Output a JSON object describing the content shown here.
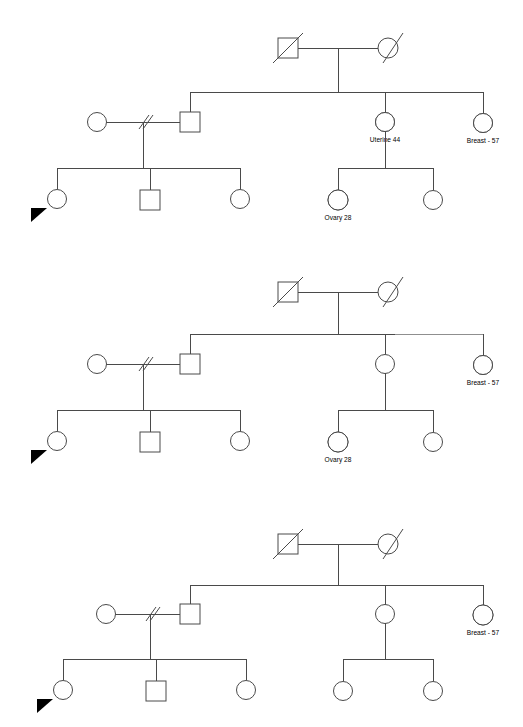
{
  "document": {
    "kind": "pedigree-chart",
    "title": "",
    "background_color": "#ffffff",
    "line_color": "#4a4a4a",
    "affected_fill_color": "#000000",
    "secondary_fill_color": "#3a3a3a",
    "panel_count": 3
  },
  "legend_semantics": {
    "square": "male",
    "circle": "female",
    "diagonal_slash_through_symbol": "deceased",
    "double_slash_on_partner_line": "separated-or-divorced",
    "filled_lower_half": "affected",
    "filled_whole": "affected-multiple",
    "black_triangle": "proband"
  },
  "panels": [
    {
      "id": "pedigree-1",
      "name": "pedigree-panel-1",
      "nodes": [
        {
          "id": "p1-gf",
          "name": "grandfather",
          "sex": "male",
          "deceased": true,
          "fill": "none",
          "label": ""
        },
        {
          "id": "p1-gm",
          "name": "grandmother",
          "sex": "female",
          "deceased": true,
          "fill": "none",
          "label": ""
        },
        {
          "id": "p1-son",
          "name": "son",
          "sex": "male",
          "deceased": false,
          "fill": "none",
          "label": ""
        },
        {
          "id": "p1-sw",
          "name": "sons-former-partner",
          "sex": "female",
          "deceased": false,
          "fill": "none",
          "label": ""
        },
        {
          "id": "p1-d1",
          "name": "daughter-uterine",
          "sex": "female",
          "deceased": false,
          "fill": "half",
          "label": "Uterine 44"
        },
        {
          "id": "p1-d2",
          "name": "daughter-breast",
          "sex": "female",
          "deceased": false,
          "fill": "half",
          "label": "Breast -  57"
        },
        {
          "id": "p1-gc1",
          "name": "grandchild-proband",
          "sex": "female",
          "deceased": false,
          "fill": "none",
          "label": ""
        },
        {
          "id": "p1-gc2",
          "name": "grandchild-male",
          "sex": "male",
          "deceased": false,
          "fill": "none",
          "label": ""
        },
        {
          "id": "p1-gc3",
          "name": "grandchild-female",
          "sex": "female",
          "deceased": false,
          "fill": "none",
          "label": ""
        },
        {
          "id": "p1-gc4",
          "name": "grandchild-ovary",
          "sex": "female",
          "deceased": false,
          "fill": "full",
          "label": "Ovary 28"
        },
        {
          "id": "p1-gc5",
          "name": "grandchild-female-2",
          "sex": "female",
          "deceased": false,
          "fill": "none",
          "label": ""
        }
      ],
      "labels": [
        {
          "for": "p1-d1",
          "text": "Uterine 44"
        },
        {
          "for": "p1-d2",
          "text": "Breast -  57"
        },
        {
          "for": "p1-gc4",
          "text": "Ovary 28"
        }
      ],
      "proband": "p1-gc1"
    },
    {
      "id": "pedigree-2",
      "name": "pedigree-panel-2",
      "nodes": [
        {
          "id": "p2-gf",
          "name": "grandfather",
          "sex": "male",
          "deceased": true,
          "fill": "none",
          "label": ""
        },
        {
          "id": "p2-gm",
          "name": "grandmother",
          "sex": "female",
          "deceased": true,
          "fill": "none",
          "label": ""
        },
        {
          "id": "p2-son",
          "name": "son",
          "sex": "male",
          "deceased": false,
          "fill": "none",
          "label": ""
        },
        {
          "id": "p2-sw",
          "name": "sons-former-partner",
          "sex": "female",
          "deceased": false,
          "fill": "none",
          "label": ""
        },
        {
          "id": "p2-d1",
          "name": "daughter-unaffected",
          "sex": "female",
          "deceased": false,
          "fill": "none",
          "label": ""
        },
        {
          "id": "p2-d2",
          "name": "daughter-breast",
          "sex": "female",
          "deceased": false,
          "fill": "half",
          "label": "Breast -  57"
        },
        {
          "id": "p2-gc1",
          "name": "grandchild-proband",
          "sex": "female",
          "deceased": false,
          "fill": "none",
          "label": ""
        },
        {
          "id": "p2-gc2",
          "name": "grandchild-male",
          "sex": "male",
          "deceased": false,
          "fill": "none",
          "label": ""
        },
        {
          "id": "p2-gc3",
          "name": "grandchild-female",
          "sex": "female",
          "deceased": false,
          "fill": "none",
          "label": ""
        },
        {
          "id": "p2-gc4",
          "name": "grandchild-ovary",
          "sex": "female",
          "deceased": false,
          "fill": "full",
          "label": "Ovary 28"
        },
        {
          "id": "p2-gc5",
          "name": "grandchild-female-2",
          "sex": "female",
          "deceased": false,
          "fill": "none",
          "label": ""
        }
      ],
      "labels": [
        {
          "for": "p2-d2",
          "text": "Breast -  57"
        },
        {
          "for": "p2-gc4",
          "text": "Ovary 28"
        }
      ],
      "proband": "p2-gc1"
    },
    {
      "id": "pedigree-3",
      "name": "pedigree-panel-3",
      "nodes": [
        {
          "id": "p3-gf",
          "name": "grandfather",
          "sex": "male",
          "deceased": true,
          "fill": "none",
          "label": ""
        },
        {
          "id": "p3-gm",
          "name": "grandmother",
          "sex": "female",
          "deceased": true,
          "fill": "none",
          "label": ""
        },
        {
          "id": "p3-son",
          "name": "son",
          "sex": "male",
          "deceased": false,
          "fill": "none",
          "label": ""
        },
        {
          "id": "p3-sw",
          "name": "sons-former-partner",
          "sex": "female",
          "deceased": false,
          "fill": "none",
          "label": ""
        },
        {
          "id": "p3-d1",
          "name": "daughter-unaffected",
          "sex": "female",
          "deceased": false,
          "fill": "none",
          "label": ""
        },
        {
          "id": "p3-d2",
          "name": "daughter-breast",
          "sex": "female",
          "deceased": false,
          "fill": "half",
          "label": "Breast -  57"
        },
        {
          "id": "p3-gc1",
          "name": "grandchild-proband",
          "sex": "female",
          "deceased": false,
          "fill": "none",
          "label": ""
        },
        {
          "id": "p3-gc2",
          "name": "grandchild-male",
          "sex": "male",
          "deceased": false,
          "fill": "none",
          "label": ""
        },
        {
          "id": "p3-gc3",
          "name": "grandchild-female",
          "sex": "female",
          "deceased": false,
          "fill": "none",
          "label": ""
        },
        {
          "id": "p3-gc4",
          "name": "grandchild-female-3",
          "sex": "female",
          "deceased": false,
          "fill": "none",
          "label": ""
        },
        {
          "id": "p3-gc5",
          "name": "grandchild-female-2",
          "sex": "female",
          "deceased": false,
          "fill": "none",
          "label": ""
        }
      ],
      "labels": [
        {
          "for": "p3-d2",
          "text": "Breast -  57"
        }
      ],
      "proband": "p3-gc1"
    }
  ],
  "text": {
    "uterine_44": "Uterine 44",
    "breast_57": "Breast -  57",
    "ovary_28": "Ovary 28"
  }
}
